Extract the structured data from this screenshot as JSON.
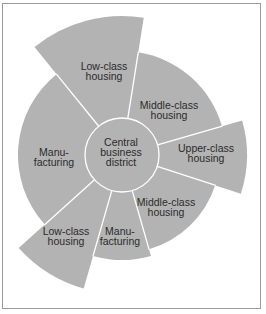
{
  "diagram": {
    "fill_color": "#b3b3b3",
    "separator_color": "#ffffff",
    "text_color": "#2b2b2b",
    "center": {
      "x": 122,
      "y": 155
    },
    "core": {
      "label_lines": [
        "Central",
        "business",
        "district"
      ],
      "radius": 37,
      "label_pos": {
        "x": 121,
        "y": 152
      }
    },
    "sectors": [
      {
        "name": "upper-class-housing",
        "label_lines": [
          "Upper-class",
          "housing"
        ],
        "start_deg": -18,
        "end_deg": 16,
        "radius": 125,
        "label_pos": {
          "x": 206,
          "y": 153
        }
      },
      {
        "name": "middle-class-housing-north",
        "label_lines": [
          "Middle-class",
          "housing"
        ],
        "start_deg": 16,
        "end_deg": 81,
        "radius": 104,
        "label_pos": {
          "x": 169,
          "y": 110
        }
      },
      {
        "name": "low-class-housing-north",
        "label_lines": [
          "Low-class",
          "housing"
        ],
        "start_deg": 81,
        "end_deg": 129,
        "radius": 139,
        "label_pos": {
          "x": 104,
          "y": 71
        }
      },
      {
        "name": "manufacturing-west",
        "label_lines": [
          "Manu-",
          "facturing"
        ],
        "start_deg": 129,
        "end_deg": 222,
        "radius": 104,
        "label_pos": {
          "x": 54,
          "y": 157
        }
      },
      {
        "name": "low-class-housing-south",
        "label_lines": [
          "Low-class",
          "housing"
        ],
        "start_deg": 222,
        "end_deg": 254,
        "radius": 139,
        "label_pos": {
          "x": 66,
          "y": 236
        }
      },
      {
        "name": "manufacturing-south",
        "label_lines": [
          "Manu-",
          "facturing"
        ],
        "start_deg": 254,
        "end_deg": 286,
        "radius": 105,
        "label_pos": {
          "x": 120,
          "y": 236
        }
      },
      {
        "name": "middle-class-housing-south",
        "label_lines": [
          "Middle-class",
          "housing"
        ],
        "start_deg": 286,
        "end_deg": 342,
        "radius": 98,
        "label_pos": {
          "x": 166,
          "y": 207
        }
      }
    ]
  }
}
